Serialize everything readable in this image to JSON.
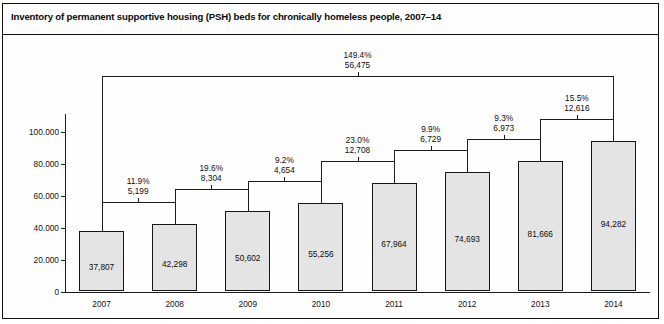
{
  "figure": {
    "title": "Inventory of permanent supportive housing (PSH) beds for chronically homeless people, 2007–14",
    "border_color": "#101010",
    "bar_fill": "#e4e4e4",
    "bar_stroke": "#151515"
  },
  "chart_data": {
    "type": "bar",
    "title": "Inventory of permanent supportive housing (PSH) beds for chronically homeless people, 2007–14",
    "xlabel": "",
    "ylabel": "",
    "categories": [
      "2007",
      "2008",
      "2009",
      "2010",
      "2011",
      "2012",
      "2013",
      "2014"
    ],
    "values": [
      37807,
      42298,
      50602,
      55256,
      67964,
      74693,
      81666,
      94282
    ],
    "value_labels": [
      "37,807",
      "42,298",
      "50,602",
      "55,256",
      "67,964",
      "74,693",
      "81,666",
      "94,282"
    ],
    "ylim": [
      0,
      100000
    ],
    "yticks": [
      0,
      20000,
      40000,
      60000,
      80000,
      100000
    ],
    "ytick_labels": [
      "0",
      "20.000",
      "40.000",
      "60.000",
      "80.000",
      "100.000"
    ],
    "grid": false,
    "legend": null,
    "annotations": [
      {
        "from": "2007",
        "to": "2008",
        "percent": "11.9%",
        "change": "5,199"
      },
      {
        "from": "2008",
        "to": "2009",
        "percent": "19.6%",
        "change": "8,304"
      },
      {
        "from": "2009",
        "to": "2010",
        "percent": "9.2%",
        "change": "4,654"
      },
      {
        "from": "2010",
        "to": "2011",
        "percent": "23.0%",
        "change": "12,708"
      },
      {
        "from": "2011",
        "to": "2012",
        "percent": "9.9%",
        "change": "6,729"
      },
      {
        "from": "2012",
        "to": "2013",
        "percent": "9.3%",
        "change": "6,973"
      },
      {
        "from": "2013",
        "to": "2014",
        "percent": "15.5%",
        "change": "12,616"
      }
    ],
    "overall_annotation": {
      "from": "2007",
      "to": "2014",
      "percent": "149.4%",
      "change": "56,475"
    }
  },
  "footnote": ""
}
